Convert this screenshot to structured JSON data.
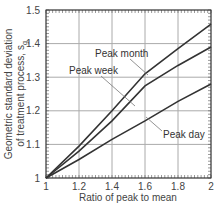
{
  "chart_data": {
    "type": "line",
    "title": "",
    "xlabel": "Ratio of peak to mean",
    "ylabel_line1": "Geometric standard deviation",
    "ylabel_line2": "of treatment process, s",
    "ylabel_subscript": "g",
    "xlim": [
      1,
      2
    ],
    "ylim": [
      1,
      1.5
    ],
    "grid": true,
    "x_ticks": [
      "1",
      "1.2",
      "1.4",
      "1.6",
      "1.8",
      "2"
    ],
    "y_ticks": [
      "1",
      "1.1",
      "1.2",
      "1.3",
      "1.4",
      "1.5"
    ],
    "x": [
      1.0,
      1.2,
      1.4,
      1.6,
      1.8,
      2.0
    ],
    "series": [
      {
        "name": "Peak month",
        "values": [
          1.0,
          1.095,
          1.2,
          1.31,
          1.385,
          1.458
        ]
      },
      {
        "name": "Peak week",
        "values": [
          1.0,
          1.08,
          1.17,
          1.274,
          1.335,
          1.39
        ]
      },
      {
        "name": "Peak day",
        "values": [
          1.0,
          1.055,
          1.115,
          1.17,
          1.228,
          1.28
        ]
      }
    ],
    "annotations": [
      {
        "text": "Peak month",
        "x": 1.3,
        "y": 1.39
      },
      {
        "text": "Peak week",
        "x": 1.05,
        "y": 1.31
      },
      {
        "text": "Peak day",
        "x": 1.6,
        "y": 1.1
      }
    ]
  }
}
